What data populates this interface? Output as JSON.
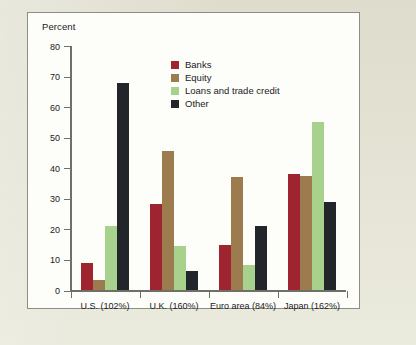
{
  "figure": {
    "panel_background": "#fdfdfa",
    "page_background": "#dedccc",
    "border_color": "#8d8d85"
  },
  "chart_data": {
    "type": "bar",
    "title": "",
    "subtitle": "",
    "xlabel": "",
    "ylabel": "Percent",
    "ylim": [
      0,
      80
    ],
    "yticks": [
      0,
      10,
      20,
      30,
      40,
      50,
      60,
      70,
      80
    ],
    "ytick_labels": [
      "0",
      "10",
      "20",
      "30",
      "40",
      "50",
      "60",
      "70",
      "80"
    ],
    "grid": false,
    "legend_position": "upper center",
    "categories": [
      "U.S. (102%)",
      "U.K. (160%)",
      "Euro area (84%)",
      "Japan (162%)"
    ],
    "series": [
      {
        "name": "Banks",
        "color": "#9e2430",
        "values": [
          9,
          28.3,
          14.8,
          38
        ]
      },
      {
        "name": "Equity",
        "color": "#9c7b4e",
        "values": [
          3.5,
          45.5,
          37,
          37.6
        ]
      },
      {
        "name": "Loans and trade credit",
        "color": "#a9d18e",
        "values": [
          21,
          14.4,
          8.4,
          55.2
        ]
      },
      {
        "name": "Other",
        "color": "#22262b",
        "values": [
          68,
          6.4,
          21,
          28.8
        ]
      }
    ]
  }
}
